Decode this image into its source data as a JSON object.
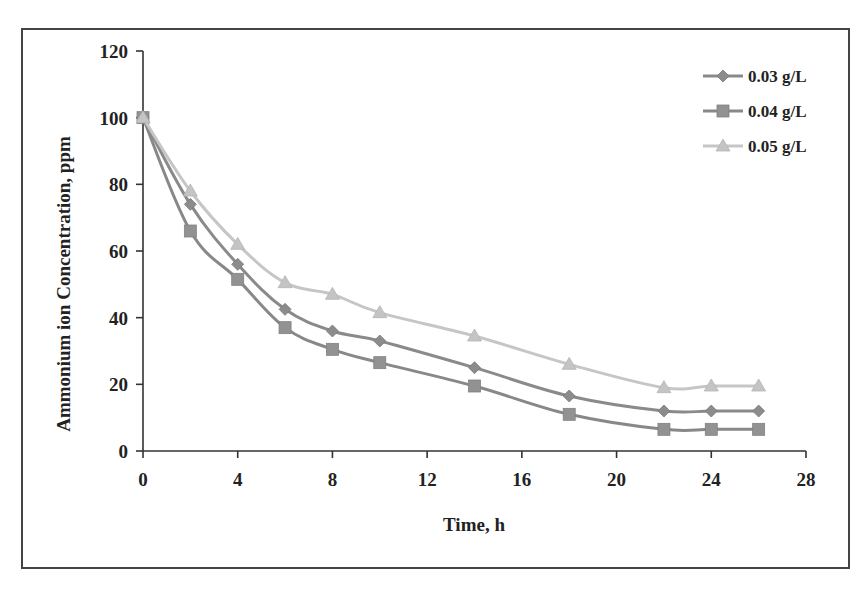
{
  "chart_data": {
    "type": "line",
    "title": "",
    "xlabel": "Time, h",
    "ylabel": "Ammonium ion Concentration, ppm",
    "xlim": [
      0,
      28
    ],
    "ylim": [
      0,
      120
    ],
    "xticks": [
      0,
      4,
      8,
      12,
      16,
      20,
      24,
      28
    ],
    "yticks": [
      0,
      20,
      40,
      60,
      80,
      100,
      120
    ],
    "grid": false,
    "legend_position": "top-right",
    "x": [
      0,
      2,
      4,
      6,
      8,
      10,
      14,
      18,
      22,
      24,
      26
    ],
    "series": [
      {
        "name": "0.03 g/L",
        "marker": "diamond",
        "color": "#8c8c8c",
        "values": [
          100,
          74,
          56,
          42.5,
          36,
          33,
          25,
          16.5,
          12,
          12,
          12
        ]
      },
      {
        "name": "0.04 g/L",
        "marker": "square",
        "color": "#929292",
        "values": [
          100,
          66,
          51.5,
          37,
          30.5,
          26.5,
          19.5,
          11,
          6.5,
          6.5,
          6.5
        ]
      },
      {
        "name": "0.05 g/L",
        "marker": "triangle",
        "color": "#c4c4c4",
        "values": [
          100,
          78,
          62,
          50.5,
          47,
          41.5,
          34.5,
          26,
          19,
          19.5,
          19.5
        ]
      }
    ]
  }
}
